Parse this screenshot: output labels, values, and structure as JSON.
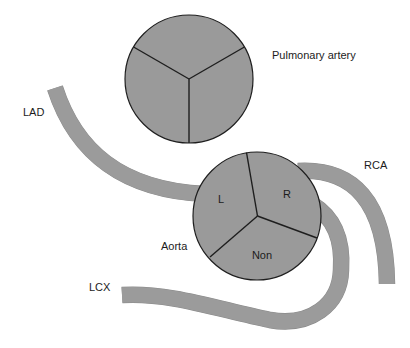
{
  "figure": {
    "colors": {
      "vessel_fill": "#9b9b9b",
      "valve_fill": "#9a9a9a",
      "outline": "#1e1e1e",
      "text": "#1c1c1c",
      "background": "#ffffff"
    }
  },
  "structures": {
    "pulmonary_artery": {
      "label": "Pulmonary artery"
    },
    "aorta": {
      "label": "Aorta",
      "cusps": {
        "left": "L",
        "right": "R",
        "non_coronary": "Non"
      }
    }
  },
  "vessels": {
    "lad": {
      "label": "LAD"
    },
    "rca": {
      "label": "RCA"
    },
    "lcx": {
      "label": "LCX"
    }
  }
}
